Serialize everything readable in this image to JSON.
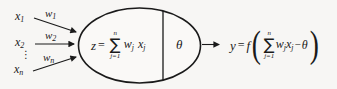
{
  "diagram_title": "artificial-neuron-model",
  "colors": {
    "background": "#f7f6f4",
    "ink": "#1a1a1a"
  },
  "inputs": {
    "items": [
      {
        "base": "x",
        "sub": "1"
      },
      {
        "base": "x",
        "sub": "2"
      },
      {
        "base": "x",
        "sub": "n"
      }
    ],
    "ellipsis": "⋮"
  },
  "weights": [
    {
      "base": "w",
      "sub": "1"
    },
    {
      "base": "w",
      "sub": "2"
    },
    {
      "base": "w",
      "sub": "n"
    }
  ],
  "neuron": {
    "lhs": "z",
    "equals": "=",
    "sum": {
      "upper": "n",
      "symbol": "∑",
      "lower": "j=1"
    },
    "body": {
      "w": "w",
      "wsub": "j",
      "x": "x",
      "xsub": "j"
    },
    "threshold": "θ"
  },
  "output": {
    "lhs": "y",
    "equals": "=",
    "function": "f",
    "paren_open": "(",
    "paren_close": ")",
    "sum": {
      "upper": "n",
      "symbol": "∑",
      "lower": "j=1"
    },
    "body": {
      "w": "w",
      "wsub": "j",
      "x": "x",
      "xsub": "j",
      "minus": "−",
      "theta": "θ"
    }
  }
}
